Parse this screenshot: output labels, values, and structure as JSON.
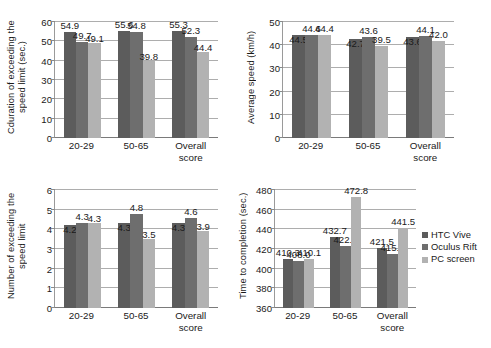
{
  "figure": {
    "series": [
      {
        "name": "HTC Vive",
        "color": "#5c5c5c"
      },
      {
        "name": "Oculus Rift",
        "color": "#6e6e6e"
      },
      {
        "name": "PC screen",
        "color": "#b2b2b2"
      }
    ],
    "categories": [
      "20-29",
      "50-65",
      "Overall score"
    ],
    "legend": {
      "position": "right-of-bottom-right-chart",
      "items": [
        "HTC Vive",
        "Oculus Rift",
        "PC screen"
      ]
    }
  },
  "chart_data": [
    {
      "id": "duration-exceeding-speed-limit",
      "type": "bar",
      "title": "",
      "xlabel": "",
      "ylabel": "Cduration of exceeding the speed limit  (sec.)",
      "categories": [
        "20-29",
        "50-65",
        "Overall score"
      ],
      "cat_lines": [
        [
          "20-29"
        ],
        [
          "50-65"
        ],
        [
          "Overall",
          "score"
        ]
      ],
      "ylim": [
        0,
        60
      ],
      "yticks": [
        0,
        10,
        20,
        30,
        40,
        50,
        60
      ],
      "ytick_labels": [
        "0",
        "10",
        "20",
        "30",
        "40",
        "50",
        "60"
      ],
      "grid": true,
      "series": [
        {
          "name": "HTC Vive",
          "values": [
            54.9,
            55.6,
            55.3
          ],
          "labels": [
            "54.9",
            "55.6",
            "55.3"
          ]
        },
        {
          "name": "Oculus Rift",
          "values": [
            49.7,
            54.8,
            52.3
          ],
          "labels": [
            "49.7",
            "54.8",
            "52.3"
          ]
        },
        {
          "name": "PC screen",
          "values": [
            49.1,
            39.8,
            44.4
          ],
          "labels": [
            "49.1",
            "39.8",
            "44.4"
          ]
        }
      ]
    },
    {
      "id": "average-speed",
      "type": "bar",
      "title": "",
      "xlabel": "",
      "ylabel": "Average speed (km/h)",
      "categories": [
        "20-29",
        "50-65",
        "Overall score"
      ],
      "cat_lines": [
        [
          "20-29"
        ],
        [
          "50-65"
        ],
        [
          "Overall",
          "score"
        ]
      ],
      "ylim": [
        0,
        50
      ],
      "yticks": [
        0,
        10,
        20,
        30,
        40,
        50
      ],
      "ytick_labels": [
        "0",
        "10",
        "20",
        "30",
        "40",
        "50"
      ],
      "grid": true,
      "series": [
        {
          "name": "HTC Vive",
          "values": [
            44.5,
            42.7,
            43.6
          ],
          "labels": [
            "44.5",
            "42.7",
            "43.6"
          ]
        },
        {
          "name": "Oculus Rift",
          "values": [
            44.6,
            43.6,
            44.1
          ],
          "labels": [
            "44.6",
            "43.6",
            "44.1"
          ]
        },
        {
          "name": "PC screen",
          "values": [
            44.4,
            39.5,
            42.0
          ],
          "labels": [
            "44.4",
            "39.5",
            "42.0"
          ]
        }
      ]
    },
    {
      "id": "number-exceeding-speed-limit",
      "type": "bar",
      "title": "",
      "xlabel": "",
      "ylabel": "Number of exceeding the speed limit",
      "categories": [
        "20-29",
        "50-65",
        "Overall score"
      ],
      "cat_lines": [
        [
          "20-29"
        ],
        [
          "50-65"
        ],
        [
          "Overall",
          "score"
        ]
      ],
      "ylim": [
        0,
        6
      ],
      "yticks": [
        0,
        1,
        2,
        3,
        4,
        5,
        6
      ],
      "ytick_labels": [
        "0",
        "1",
        "2",
        "3",
        "4",
        "5",
        "6"
      ],
      "grid": true,
      "series": [
        {
          "name": "HTC Vive",
          "values": [
            4.2,
            4.3,
            4.3
          ],
          "labels": [
            "4.2",
            "4.3",
            "4.3"
          ]
        },
        {
          "name": "Oculus Rift",
          "values": [
            4.3,
            4.8,
            4.6
          ],
          "labels": [
            "4.3",
            "4.8",
            "4.6"
          ]
        },
        {
          "name": "PC screen",
          "values": [
            4.3,
            3.5,
            3.9
          ],
          "labels": [
            "4.3",
            "3.5",
            "3.9"
          ]
        }
      ]
    },
    {
      "id": "time-to-completion",
      "type": "bar",
      "title": "",
      "xlabel": "",
      "ylabel": "Time to completion (sec.)",
      "categories": [
        "20-29",
        "50-65",
        "Overall score"
      ],
      "cat_lines": [
        [
          "20-29"
        ],
        [
          "50-65"
        ],
        [
          "Overall",
          "score"
        ]
      ],
      "ylim": [
        360,
        480
      ],
      "yticks": [
        360,
        380,
        400,
        420,
        440,
        460,
        480
      ],
      "ytick_labels": [
        "360",
        "380",
        "400",
        "420",
        "440",
        "460",
        "480"
      ],
      "grid": true,
      "series": [
        {
          "name": "HTC Vive",
          "values": [
            410.3,
            432.7,
            421.5
          ],
          "labels": [
            "410.3",
            "432.7",
            "421.5"
          ]
        },
        {
          "name": "Oculus Rift",
          "values": [
            408.0,
            422.8,
            415.4
          ],
          "labels": [
            "408.0",
            "422.8",
            "415.4"
          ]
        },
        {
          "name": "PC screen",
          "values": [
            410.1,
            472.8,
            441.5
          ],
          "labels": [
            "410.1",
            "472.8",
            "441.5"
          ]
        }
      ]
    }
  ]
}
